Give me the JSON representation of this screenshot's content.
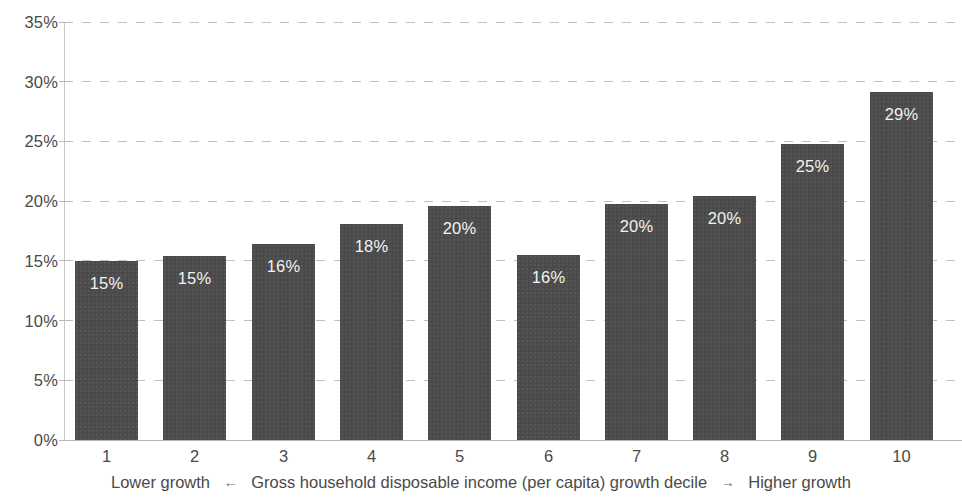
{
  "chart_data": {
    "type": "bar",
    "title": "",
    "subtitle": "",
    "xlabel": "Gross household disposable income (per capita) growth decile",
    "ylabel": "",
    "categories": [
      "1",
      "2",
      "3",
      "4",
      "5",
      "6",
      "7",
      "8",
      "9",
      "10"
    ],
    "values": [
      15.0,
      15.4,
      16.4,
      18.1,
      19.6,
      15.5,
      19.8,
      20.4,
      24.8,
      29.1
    ],
    "data_labels": [
      "15%",
      "15%",
      "16%",
      "18%",
      "20%",
      "16%",
      "20%",
      "20%",
      "25%",
      "29%"
    ],
    "ylim": [
      0,
      35
    ],
    "ytick_values": [
      0,
      5,
      10,
      15,
      20,
      25,
      30,
      35
    ],
    "ytick_labels": [
      "0%",
      "5%",
      "10%",
      "15%",
      "20%",
      "25%",
      "30%",
      "35%"
    ],
    "grid": true,
    "grid_axis": "y",
    "grid_style": "dashed",
    "legend": false,
    "legend_position": "none",
    "bar_color": "#4b4b4b",
    "gridline_color": "#bfbfbf",
    "axis_text_color": "#4a4a4a",
    "label_text_color": "#f2f2f2",
    "background_color": "#ffffff"
  },
  "axis_caption": {
    "left_text": "Lower growth",
    "left_arrow": "←",
    "center_text": "Gross household disposable income (per capita) growth decile",
    "right_arrow": "→",
    "right_text": "Higher growth"
  }
}
